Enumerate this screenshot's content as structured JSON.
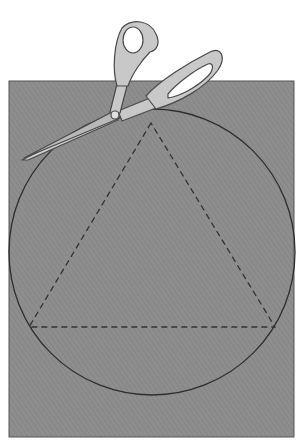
{
  "figure": {
    "colors": {
      "background": "#ffffff",
      "paper": "#8e8e8e",
      "paper_hatch": "#7d7d7d",
      "paper_border": "#555555",
      "circle_line": "#2e2e2e",
      "dashed_line": "#333333",
      "scissors_fill": "#c8c8c8",
      "scissors_shade": "#a9a9a9",
      "scissors_outline": "#4a4a4a"
    },
    "paper": {
      "x": 9,
      "y": 81,
      "width": 285,
      "height": 356
    },
    "circle": {
      "cx": 152,
      "cy": 252,
      "r": 143
    },
    "triangle": {
      "apex": [
        151,
        123
      ],
      "bottom_left": [
        29,
        327
      ],
      "bottom_right": [
        275,
        327
      ],
      "style": "dashed"
    },
    "scissors": {
      "pivot": [
        115,
        115
      ],
      "tip": [
        22,
        160
      ]
    }
  }
}
